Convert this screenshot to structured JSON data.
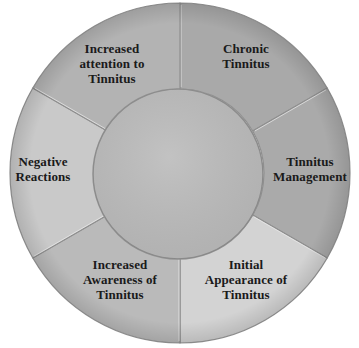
{
  "diagram": {
    "type": "cycle-ring",
    "center_label": "",
    "segments": [
      {
        "id": "chronic-tinnitus",
        "lines": [
          "Chronic",
          "Tinnitus"
        ],
        "color": "#a9a9a9",
        "label_pos": {
          "x": 246,
          "y": 56
        }
      },
      {
        "id": "tinnitus-management",
        "lines": [
          "Tinnitus",
          "Management"
        ],
        "color": "#aaaaaa",
        "label_pos": {
          "x": 310,
          "y": 169
        }
      },
      {
        "id": "initial-appearance",
        "lines": [
          "Initial",
          "Appearance of",
          "Tinnitus"
        ],
        "color": "#d3d3d3",
        "label_pos": {
          "x": 246,
          "y": 279
        }
      },
      {
        "id": "increased-awareness",
        "lines": [
          "Increased",
          "Awareness of",
          "Tinnitus"
        ],
        "color": "#bababa",
        "label_pos": {
          "x": 120,
          "y": 279
        }
      },
      {
        "id": "negative-reactions",
        "lines": [
          "Negative",
          "Reactions"
        ],
        "color": "#c9c9c9",
        "label_pos": {
          "x": 43,
          "y": 169
        }
      },
      {
        "id": "increased-attention",
        "lines": [
          "Increased",
          "attention to",
          "Tinnitus"
        ],
        "color": "#b3b3b3",
        "label_pos": {
          "x": 112,
          "y": 63
        }
      }
    ],
    "center_color": "#bdbdbd",
    "divider_color": "#8f8f8f",
    "text_color": "#1a1a1a"
  }
}
